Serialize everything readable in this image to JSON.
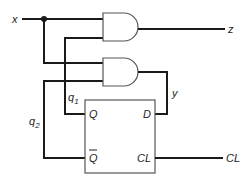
{
  "diagram": {
    "type": "sequential logic circuit",
    "inputs": {
      "x": "x",
      "clock": "CL"
    },
    "outputs": {
      "z": "z"
    },
    "gates": [
      {
        "id": "and1",
        "type": "AND",
        "inputs": [
          "x",
          "q1"
        ],
        "output": "z"
      },
      {
        "id": "and2",
        "type": "AND",
        "inputs": [
          "x",
          "q2"
        ],
        "output": "y"
      }
    ],
    "flipflop": {
      "type": "D flip-flop",
      "pins": {
        "q": "Q",
        "qbar": "Q",
        "d": "D",
        "cl": "CL"
      }
    },
    "signals": {
      "q1": "q",
      "q1_sub": "1",
      "q2": "q",
      "q2_sub": "2",
      "y": "y"
    }
  }
}
